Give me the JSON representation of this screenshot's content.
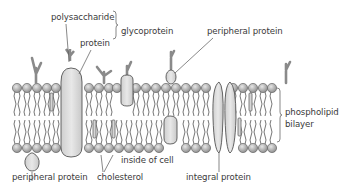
{
  "diagram": {
    "labels": {
      "polysaccharide": "polysaccharide",
      "protein": "protein",
      "glycoprotein": "glycoprotein",
      "peripheral_protein_top": "peripheral protein",
      "phospholipid": "phospholipid",
      "bilayer": "bilayer",
      "inside_of_cell": "inside of cell",
      "peripheral_protein_bottom": "peripheral protein",
      "cholesterol": "cholesterol",
      "integral_protein": "integral protein"
    },
    "colors": {
      "head_fill": "#b5b5b5",
      "protein_fill": "#dcdcdc",
      "outline": "#555555",
      "text": "#3a3a3a",
      "leader_line": "#555555"
    }
  }
}
